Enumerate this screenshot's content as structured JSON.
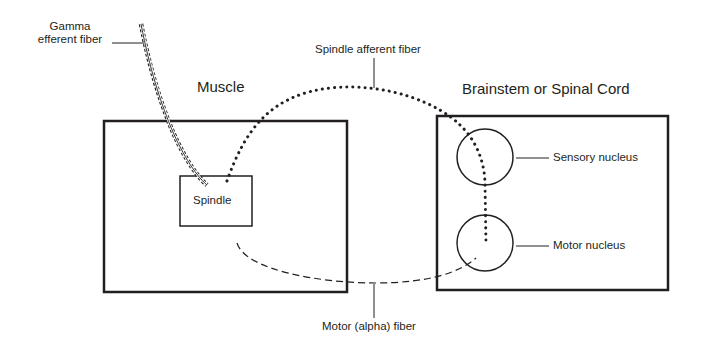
{
  "diagram": {
    "regions": {
      "muscle": {
        "title": "Muscle"
      },
      "cns": {
        "title": "Brainstem or Spinal Cord"
      }
    },
    "structures": {
      "spindle": {
        "label": "Spindle"
      },
      "sensory_nucleus": {
        "label": "Sensory nucleus"
      },
      "motor_nucleus": {
        "label": "Motor nucleus"
      }
    },
    "fibers": {
      "gamma": {
        "label_line1": "Gamma",
        "label_line2": "efferent fiber",
        "style": "double-solid with dashed edges"
      },
      "spindle_afferent": {
        "label": "Spindle afferent fiber",
        "style": "dotted"
      },
      "motor_alpha": {
        "label": "Motor (alpha) fiber",
        "style": "dashed"
      }
    },
    "colors": {
      "line": "#231f20",
      "background": "#ffffff"
    }
  }
}
